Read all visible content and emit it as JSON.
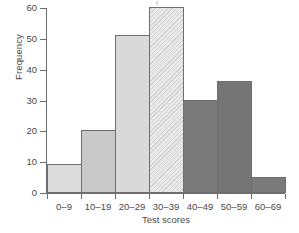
{
  "chart_data": {
    "type": "bar",
    "title": "",
    "xlabel": "Test scores",
    "ylabel": "Frequency",
    "categories": [
      "0–9",
      "10–19",
      "20–29",
      "30–39",
      "40–49",
      "50–59",
      "60–69"
    ],
    "values": [
      9,
      20,
      51,
      60,
      30,
      36,
      5
    ],
    "ylim": [
      0,
      60
    ],
    "yticks": [
      0,
      10,
      20,
      30,
      40,
      50,
      60
    ],
    "ytick_labels": [
      "0",
      "10",
      "20",
      "30",
      "40",
      "50",
      "60"
    ],
    "grid": false,
    "legend": false,
    "bar_colors": [
      "#dcdcdc",
      "#c9c9c9",
      "#d9d9d9",
      "#e9e9e9",
      "#7a7a7a",
      "#757575",
      "#7a7a7a"
    ],
    "bar_patterns": [
      "solid",
      "solid",
      "solid",
      "diagonal-hatch",
      "solid",
      "solid",
      "solid"
    ],
    "bar_edge_color": "#6e6e6e",
    "axis_color": "#6e6e6e",
    "text_color": "#4a4a4a",
    "background": "#ffffff"
  }
}
